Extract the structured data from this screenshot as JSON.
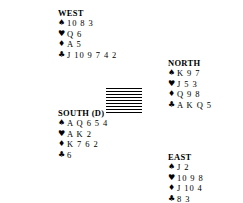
{
  "diagram": {
    "type": "bridge-hand-diagram",
    "suit_symbols": {
      "spades": "♠",
      "hearts": "♥",
      "diamonds": "♦",
      "clubs": "♣"
    },
    "center": {
      "name": "hatched-table",
      "pattern": "horizontal-lines"
    },
    "hands": [
      {
        "position": "west",
        "label": "WEST",
        "suits": [
          {
            "suit": "spades",
            "symbol": "♠",
            "cards": "10 8 3"
          },
          {
            "suit": "hearts",
            "symbol": "♥",
            "cards": "Q 6"
          },
          {
            "suit": "diamonds",
            "symbol": "♦",
            "cards": "A 5"
          },
          {
            "suit": "clubs",
            "symbol": "♣",
            "cards": "J 10 9 7 4 2"
          }
        ]
      },
      {
        "position": "north",
        "label": "NORTH",
        "suits": [
          {
            "suit": "spades",
            "symbol": "♠",
            "cards": "K 9 7"
          },
          {
            "suit": "hearts",
            "symbol": "♥",
            "cards": "J 5 3"
          },
          {
            "suit": "diamonds",
            "symbol": "♦",
            "cards": "Q 9 8"
          },
          {
            "suit": "clubs",
            "symbol": "♣",
            "cards": "A K Q 5"
          }
        ]
      },
      {
        "position": "south",
        "label": "SOUTH (D)",
        "suits": [
          {
            "suit": "spades",
            "symbol": "♠",
            "cards": "A Q 6 5 4"
          },
          {
            "suit": "hearts",
            "symbol": "♥",
            "cards": "A K 2"
          },
          {
            "suit": "diamonds",
            "symbol": "♦",
            "cards": "K 7 6 2"
          },
          {
            "suit": "clubs",
            "symbol": "♣",
            "cards": "6"
          }
        ]
      },
      {
        "position": "east",
        "label": "EAST",
        "suits": [
          {
            "suit": "spades",
            "symbol": "♠",
            "cards": "J 2"
          },
          {
            "suit": "hearts",
            "symbol": "♥",
            "cards": "10 9 8"
          },
          {
            "suit": "diamonds",
            "symbol": "♦",
            "cards": "J 10 4"
          },
          {
            "suit": "clubs",
            "symbol": "♣",
            "cards": "8 3"
          }
        ]
      }
    ]
  }
}
